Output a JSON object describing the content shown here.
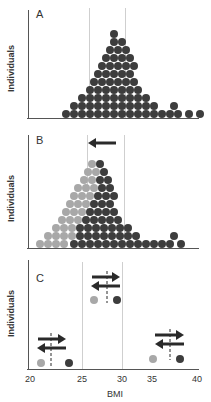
{
  "figure": {
    "panels": [
      {
        "letter": "A",
        "ylabel": "Individuals"
      },
      {
        "letter": "B",
        "ylabel": "Individuals"
      },
      {
        "letter": "C",
        "ylabel": "Individuals"
      }
    ],
    "xaxis": {
      "label": "BMI",
      "ticks": [
        "20",
        "25",
        "30",
        "35",
        "40"
      ]
    }
  },
  "colors": {
    "dark_dot": "#3d3d3d",
    "light_dot": "#a8a8a8",
    "axis": "#555555",
    "reference_line": "#cfcfcf",
    "arrow": "#2a2a2a"
  },
  "chart_data": [
    {
      "panel": "A",
      "type": "scatter",
      "title": "A",
      "xlabel": "BMI",
      "ylabel": "Individuals",
      "xlim": [
        20,
        40
      ],
      "reference_lines_bmi": [
        25,
        30
      ],
      "description": "Dot histogram of BMI distribution in a population; right-skewed, mode near BMI 27",
      "rows_from_bottom": [
        {
          "row": 1,
          "count": 17
        },
        {
          "row": 2,
          "count": 11
        },
        {
          "row": 3,
          "count": 9
        },
        {
          "row": 4,
          "count": 7
        },
        {
          "row": 5,
          "count": 6
        },
        {
          "row": 6,
          "count": 5
        },
        {
          "row": 7,
          "count": 5
        },
        {
          "row": 8,
          "count": 4
        },
        {
          "row": 9,
          "count": 3
        },
        {
          "row": 10,
          "count": 2
        },
        {
          "row": 11,
          "count": 1
        }
      ],
      "series": [
        {
          "name": "population",
          "color": "dark"
        }
      ]
    },
    {
      "panel": "B",
      "type": "scatter",
      "title": "B",
      "xlabel": "BMI",
      "ylabel": "Individuals",
      "xlim": [
        20,
        40
      ],
      "reference_lines_bmi": [
        25,
        30
      ],
      "annotation": "Leftward arrow above distribution (shift toward lower BMI)",
      "description": "Same distribution with light-grey dots shifted left (lower BMI) overlaid on dark original distribution",
      "series": [
        {
          "name": "shifted (lower BMI)",
          "color": "light"
        },
        {
          "name": "original",
          "color": "dark"
        }
      ]
    },
    {
      "panel": "C",
      "type": "scatter",
      "title": "C",
      "xlabel": "BMI",
      "ylabel": "Individuals",
      "xlim": [
        20,
        40
      ],
      "reference_lines_bmi": [
        25,
        30
      ],
      "annotation": "Pairs of light/dark dots with bidirectional arrows and dashed midline, showing individual-level BMI change",
      "pairs": [
        {
          "light_bmi": 21,
          "dark_bmi": 24,
          "midpoint_bmi": 22,
          "level": "low"
        },
        {
          "light_bmi": 26.5,
          "dark_bmi": 29.5,
          "midpoint_bmi": 28.3,
          "level": "high"
        },
        {
          "light_bmi": 35,
          "dark_bmi": 38,
          "midpoint_bmi": 37,
          "level": "low"
        }
      ],
      "series": [
        {
          "name": "lower BMI",
          "color": "light"
        },
        {
          "name": "higher BMI",
          "color": "dark"
        }
      ]
    }
  ]
}
